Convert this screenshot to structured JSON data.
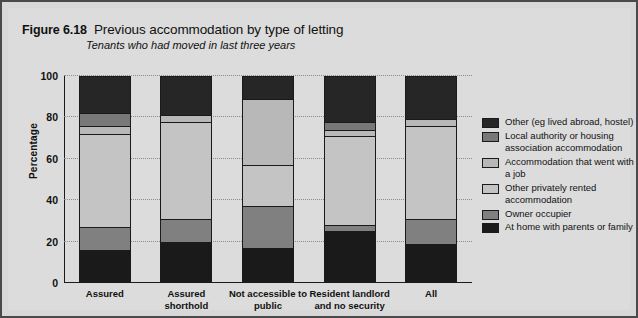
{
  "figure": {
    "number": "Figure 6.18",
    "title": "Previous accommodation by type of letting",
    "subtitle": "Tenants who had moved in last three years"
  },
  "chart_data": {
    "type": "bar",
    "stacked": true,
    "title": "Previous accommodation by type of letting",
    "subtitle": "Tenants who had moved in last three years",
    "xlabel": "",
    "ylabel": "Percentage",
    "ylim": [
      0,
      100
    ],
    "yticks": [
      0,
      20,
      40,
      60,
      80,
      100
    ],
    "grid": true,
    "legend_position": "right",
    "categories": [
      "Assured",
      "Assured shorthold",
      "Not accessible to public",
      "Resident landlord and no security",
      "All"
    ],
    "series": [
      {
        "name": "At home with parents or family",
        "color": "#1a1a1a",
        "values": [
          16,
          20,
          17,
          25,
          19
        ]
      },
      {
        "name": "Owner occupier",
        "color": "#808080",
        "values": [
          11,
          11,
          20,
          3,
          12
        ]
      },
      {
        "name": "Other privately rented accommodation",
        "color": "#c4c4c4",
        "values": [
          45,
          47,
          20,
          43,
          45
        ]
      },
      {
        "name": "Accommodation that went with a job",
        "color": "#b8b8b8",
        "values": [
          4,
          3,
          32,
          3,
          3
        ]
      },
      {
        "name": "Local authority or housing association accommodation",
        "color": "#787878",
        "values": [
          6,
          0,
          0,
          4,
          0
        ]
      },
      {
        "name": "Other (eg lived abroad, hostel)",
        "color": "#262626",
        "values": [
          18,
          19,
          11,
          22,
          21
        ]
      }
    ]
  },
  "legend": {
    "items": [
      {
        "label": "Other (eg lived abroad, hostel)",
        "color": "#262626"
      },
      {
        "label": "Local authority or housing association accommodation",
        "color": "#787878"
      },
      {
        "label": "Accommodation that went with a job",
        "color": "#b8b8b8"
      },
      {
        "label": "Other privately rented accommodation",
        "color": "#c4c4c4"
      },
      {
        "label": "Owner occupier",
        "color": "#808080"
      },
      {
        "label": "At home with parents or family",
        "color": "#1a1a1a"
      }
    ]
  },
  "axis": {
    "y_title": "Percentage",
    "y_ticks": [
      "0",
      "20",
      "40",
      "60",
      "80",
      "100"
    ]
  }
}
